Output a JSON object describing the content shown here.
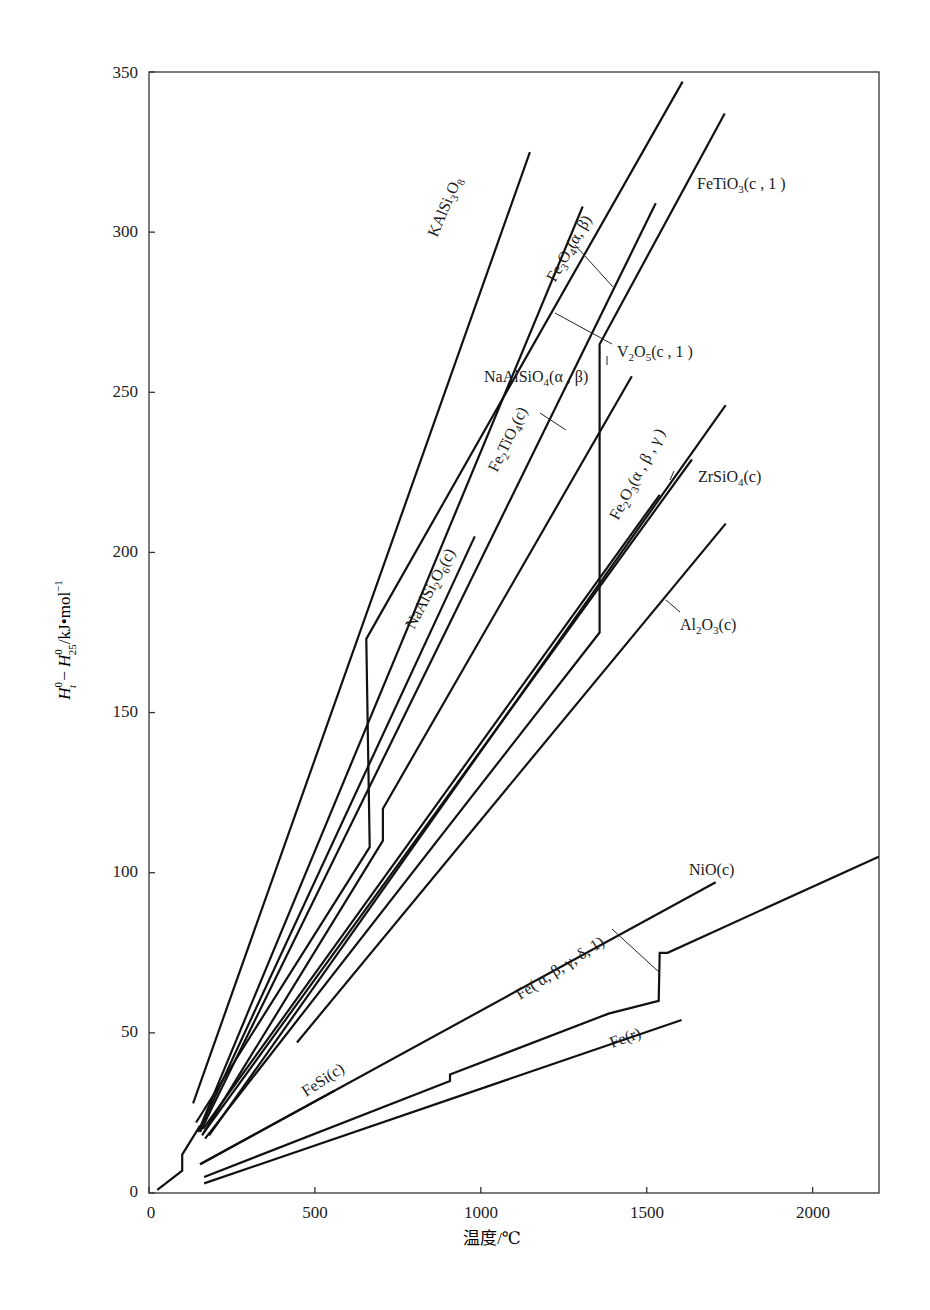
{
  "chart_data": {
    "type": "line",
    "title": "",
    "xlabel": "温度/℃",
    "ylabel": "H_t^0 − H_25^0 /kJ·mol⁻¹",
    "ylabel_parts": {
      "h1": "H",
      "sup1": "0",
      "sub1": "t",
      "minus": " − ",
      "h2": "H",
      "sup2": "0",
      "sub2": "25",
      "unit": "/kJ•mol",
      "unit_sup": "−1"
    },
    "xlim": [
      0,
      2200
    ],
    "ylim": [
      0,
      350
    ],
    "xticks": [
      0,
      500,
      1000,
      1500,
      2000
    ],
    "yticks": [
      0,
      50,
      100,
      150,
      200,
      250,
      300,
      350
    ],
    "grid": false,
    "legend": "inline labels",
    "series": [
      {
        "name": "KAlSi3O8",
        "points": [
          [
            133,
            28
          ],
          [
            1148,
            325
          ]
        ]
      },
      {
        "name": "Fe3O4(α, β)",
        "points": [
          [
            142,
            22
          ],
          [
            665,
            108
          ],
          [
            655,
            173
          ],
          [
            1608,
            347
          ]
        ]
      },
      {
        "name": "NaAlSi2O6(c)",
        "points": [
          [
            154,
            20
          ],
          [
            982,
            205
          ]
        ]
      },
      {
        "name": "Fe2TiO4(c)",
        "points": [
          [
            148,
            19
          ],
          [
            1307,
            308
          ]
        ]
      },
      {
        "name": "NaAlSiO4(α, β)",
        "points": [
          [
            160,
            18
          ],
          [
            705,
            110
          ],
          [
            705,
            120
          ],
          [
            1455,
            255
          ]
        ]
      },
      {
        "name": "V2O5(c, 1)",
        "points": [
          [
            154,
            19
          ],
          [
            1527,
            309
          ]
        ]
      },
      {
        "name": "FeTiO3(c, 1)",
        "points": [
          [
            169,
            17
          ],
          [
            1358,
            175
          ],
          [
            1358,
            265
          ],
          [
            1735,
            337
          ]
        ]
      },
      {
        "name": "Fe2O3(α, β, γ)",
        "points": [
          [
            163,
            20
          ],
          [
            1539,
            218
          ]
        ]
      },
      {
        "name": "ZrSiO4(c)",
        "points": [
          [
            166,
            19
          ],
          [
            1636,
            229
          ]
        ]
      },
      {
        "name": "unlabeled",
        "points": [
          [
            181,
            18
          ],
          [
            1738,
            246
          ]
        ]
      },
      {
        "name": "Al2O3(c)",
        "points": [
          [
            446,
            47
          ],
          [
            1738,
            209
          ]
        ]
      },
      {
        "name": "NiO(c)",
        "points": [
          [
            154,
            9
          ],
          [
            1708,
            97
          ]
        ]
      },
      {
        "name": "FeSi(c)",
        "points": [
          [
            154,
            9
          ],
          [
            560,
            32
          ]
        ]
      },
      {
        "name": "Fe(α, β, γ, δ, 1)",
        "points": [
          [
            166,
            5
          ],
          [
            907,
            35
          ],
          [
            907,
            37
          ],
          [
            1385,
            56
          ],
          [
            1536,
            60
          ],
          [
            1539,
            75
          ],
          [
            1563,
            75
          ],
          [
            2199,
            105
          ]
        ]
      },
      {
        "name": "Fe(r)",
        "points": [
          [
            166,
            3
          ],
          [
            1605,
            54
          ]
        ]
      },
      {
        "name": "low-T segment",
        "points": [
          [
            25,
            1
          ],
          [
            100,
            7
          ],
          [
            100,
            12
          ],
          [
            154,
            21
          ]
        ]
      }
    ],
    "annotations": [
      {
        "text": "KAlSi₃O₈",
        "x": 840,
        "y": 260
      },
      {
        "text": "Fe₃O₄(α, β)",
        "x": 1230,
        "y": 275
      },
      {
        "text": "FeTiO₃(c, 1)",
        "x": 1660,
        "y": 315
      },
      {
        "text": "V₂O₅(c, 1)",
        "x": 1700,
        "y": 262
      },
      {
        "text": "NaAlSiO₄(α, β)",
        "x": 1050,
        "y": 250
      },
      {
        "text": "Fe₂TiO₄(c)",
        "x": 1020,
        "y": 230
      },
      {
        "text": "NaAlSi₂O₆(c)",
        "x": 780,
        "y": 175
      },
      {
        "text": "Fe₂O₃(α, β, γ)",
        "x": 1460,
        "y": 200
      },
      {
        "text": "ZrSiO₄(c)",
        "x": 1660,
        "y": 226
      },
      {
        "text": "Al₂O₃(c)",
        "x": 1600,
        "y": 178
      },
      {
        "text": "NiO(c)",
        "x": 1600,
        "y": 102
      },
      {
        "text": "Fe(α, β, γ, δ, 1)",
        "x": 1050,
        "y": 72
      },
      {
        "text": "FeSi(c)",
        "x": 400,
        "y": 32
      },
      {
        "text": "Fe(r)",
        "x": 1150,
        "y": 44
      }
    ]
  },
  "axis": {
    "xtick_labels": [
      "0",
      "500",
      "1000",
      "1500",
      "2000"
    ],
    "ytick_labels": [
      "0",
      "50",
      "100",
      "150",
      "200",
      "250",
      "300",
      "350"
    ],
    "xlabel": "温度/℃"
  },
  "labels": {
    "kalsi": "KAlSi",
    "kalsi_sub1": "3",
    "kalsi_o": "O",
    "kalsi_sub2": "8",
    "fe3o4": "Fe",
    "fe3o4_s1": "3",
    "fe3o4_o": "O",
    "fe3o4_s2": "4",
    "fe3o4_tail": "(α, β)",
    "fetio3": "FeTiO",
    "fetio3_s": "3",
    "fetio3_tail": "(c , 1 )",
    "v2o5": "V",
    "v2o5_s1": "2",
    "v2o5_o": "O",
    "v2o5_s2": "5",
    "v2o5_tail": "(c , 1 )",
    "naalsio4": "NaAlSiO",
    "naalsio4_s": "4",
    "naalsio4_tail": "(α , β)",
    "fe2tio4": "Fe",
    "fe2tio4_s1": "2",
    "fe2tio4_mid": "TiO",
    "fe2tio4_s2": "4",
    "fe2tio4_tail": "(c)",
    "naalsi2o6": "NaAlSi",
    "naalsi2o6_s1": "2",
    "naalsi2o6_o": "O",
    "naalsi2o6_s2": "6",
    "naalsi2o6_tail": "(c)",
    "fe2o3": "Fe",
    "fe2o3_s1": "2",
    "fe2o3_o": "O",
    "fe2o3_s2": "3",
    "fe2o3_tail": "(α , β , γ )",
    "zrsio4": "ZrSiO",
    "zrsio4_s": "4",
    "zrsio4_tail": "(c)",
    "al2o3": "Al",
    "al2o3_s1": "2",
    "al2o3_o": "O",
    "al2o3_s2": "3",
    "al2o3_tail": "(c)",
    "nio": "NiO(c)",
    "fe": "Fe( α, β, γ, δ, 1)",
    "fesi": "FeSi(c)",
    "fer": "Fe(r)"
  }
}
